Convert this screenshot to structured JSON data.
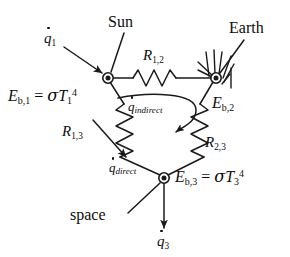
{
  "figure": {
    "type": "thermal-radiation-resistance-network",
    "background_color": "#ffffff",
    "line_color": "#1a1a1a"
  },
  "nodes": [
    {
      "id": "node1",
      "name": "Sun",
      "callout_label": "Sun",
      "emissive_power_label": "E_{b,1} = σT_1^4",
      "e_symbol": "E",
      "e_sub": "b,1",
      "equals": "=",
      "sigma": "σ",
      "t_symbol": "T",
      "t_sub": "1",
      "t_sup": "4",
      "x": 108,
      "y": 78
    },
    {
      "id": "node2",
      "name": "Earth",
      "callout_label": "Earth",
      "emissive_power_label": "E_{b,2}",
      "e_symbol": "E",
      "e_sub": "b,2",
      "x": 216,
      "y": 78
    },
    {
      "id": "node3",
      "name": "space",
      "callout_label": "space",
      "emissive_power_label": "E_{b,3} = σT_3^4",
      "e_symbol": "E",
      "e_sub": "b,3",
      "equals": "=",
      "sigma": "σ",
      "t_symbol": "T",
      "t_sub": "3",
      "t_sup": "4",
      "x": 164,
      "y": 178
    }
  ],
  "resistors": [
    {
      "id": "R12",
      "label_symbol": "R",
      "label_sub": "1,2",
      "between": [
        "node1",
        "node2"
      ],
      "orientation": "horizontal"
    },
    {
      "id": "R13",
      "label_symbol": "R",
      "label_sub": "1,3",
      "between": [
        "node1",
        "node3"
      ],
      "orientation": "diagonal-left"
    },
    {
      "id": "R23",
      "label_symbol": "R",
      "label_sub": "2,3",
      "between": [
        "node2",
        "node3"
      ],
      "orientation": "diagonal-right"
    }
  ],
  "fluxes": [
    {
      "id": "q1",
      "symbol": "q",
      "sub": "1",
      "label": "q̇1",
      "target": "node1",
      "description": "incoming heat flux arrow into Sun node"
    },
    {
      "id": "q_indirect",
      "symbol": "q",
      "sub": "indirect",
      "label": "q̇indirect",
      "description": "curved arrow indicating indirect path"
    },
    {
      "id": "q_direct",
      "symbol": "q",
      "sub": "direct",
      "label": "q̇direct",
      "description": "arrow along R_{1,3} branch"
    },
    {
      "id": "q3",
      "symbol": "q",
      "sub": "3",
      "label": "q̇3",
      "target": "node3",
      "description": "outgoing heat flux arrow from space node"
    }
  ],
  "annotations": {
    "earth_ground_hatching": "ground-hatch-marks",
    "sun_leader": "leader line from Sun text to node 1",
    "earth_leader": "leader line from Earth text to node 2",
    "space_leader": "leader line from space text to node 3"
  }
}
